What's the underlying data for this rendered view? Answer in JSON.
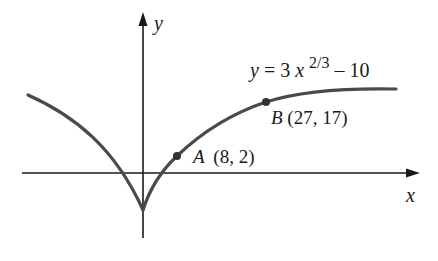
{
  "diagram": {
    "equation": {
      "lhs": "y",
      "eq": " = 3",
      "var": "x",
      "exponent": "2/3",
      "rest": " – 10"
    },
    "axes": {
      "x_label": "x",
      "y_label": "y"
    },
    "points": [
      {
        "name": "A",
        "coords": "(8, 2)",
        "x": 8,
        "y": 2
      },
      {
        "name": "B",
        "coords": "(27, 17)",
        "x": 27,
        "y": 17
      }
    ],
    "colors": {
      "curve": "#4a4a4a",
      "axis": "#1a1a1a",
      "text": "#1a1a1a"
    }
  }
}
